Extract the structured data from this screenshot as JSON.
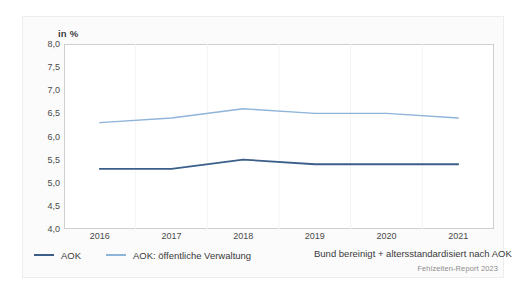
{
  "unit_label": "in %",
  "source_note": "Fehlzeiten-Report 2023",
  "legend": {
    "items": [
      {
        "label": "AOK",
        "color": "#3c5f8a"
      },
      {
        "label": "AOK: öffentliche Verwaltung",
        "color": "#8fb4d9"
      }
    ],
    "note": "Bund bereinigt + altersstandardisiert nach AOK"
  },
  "chart_data": {
    "type": "line",
    "title": "",
    "subtitle": "",
    "xlabel": "",
    "ylabel": "in %",
    "categories": [
      "2016",
      "2017",
      "2018",
      "2019",
      "2020",
      "2021"
    ],
    "x": [
      2016,
      2017,
      2018,
      2019,
      2020,
      2021
    ],
    "ylim": [
      4.0,
      8.0
    ],
    "yticks": [
      4.0,
      4.5,
      5.0,
      5.5,
      6.0,
      6.5,
      7.0,
      7.5,
      8.0
    ],
    "ytick_labels": [
      "4,0",
      "4,5",
      "5,0",
      "5,5",
      "6,0",
      "6,5",
      "7,0",
      "7,5",
      "8,0"
    ],
    "grid": false,
    "legend_position": "bottom",
    "series": [
      {
        "name": "AOK",
        "color": "#3c5f8a",
        "values": [
          5.3,
          5.3,
          5.5,
          5.4,
          5.4,
          5.4
        ]
      },
      {
        "name": "AOK: öffentliche Verwaltung",
        "color": "#8fb4d9",
        "values": [
          6.3,
          6.4,
          6.6,
          6.5,
          6.5,
          6.4
        ]
      }
    ],
    "annotations": [
      "Bund bereinigt + altersstandardisiert nach AOK",
      "Fehlzeiten-Report 2023"
    ]
  }
}
